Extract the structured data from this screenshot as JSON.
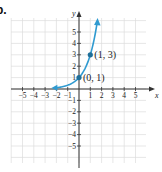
{
  "part_label": "b.",
  "colors": {
    "curve": "#2f9ad0",
    "point": "#1f6f99",
    "grid": "#dcdcdc",
    "axis": "#333333",
    "text": "#222222"
  },
  "chart_data": {
    "type": "line",
    "title": "",
    "function": "y = 3^x",
    "xlabel": "x",
    "ylabel": "y",
    "xlim": [
      -5.9,
      6
    ],
    "ylim": [
      -6.5,
      6.5
    ],
    "grid": true,
    "x_ticks": [
      -5,
      -4,
      -3,
      -2,
      -1,
      1,
      2,
      3,
      4,
      5
    ],
    "y_ticks": [
      -5,
      -4,
      -3,
      -2,
      -1,
      1,
      2,
      3,
      4,
      5
    ],
    "x_tick_labels": [
      "−5",
      "−4",
      "−3",
      "−2",
      "−1",
      "1",
      "2",
      "3",
      "4",
      "5"
    ],
    "y_tick_labels": [
      "−5",
      "−4",
      "−3",
      "−2",
      "−1",
      "1",
      "2",
      "3",
      "4",
      "5"
    ],
    "series": [
      {
        "name": "exponential curve",
        "x": [
          -2,
          -1.5,
          -1,
          -0.5,
          0,
          0.5,
          1,
          1.3,
          1.6
        ],
        "values": [
          0.11,
          0.19,
          0.33,
          0.58,
          1,
          1.73,
          3,
          4.17,
          5.8
        ],
        "arrows": "both"
      }
    ],
    "points": [
      {
        "x": 0,
        "y": 1,
        "label": "(0, 1)"
      },
      {
        "x": 1,
        "y": 3,
        "label": "(1, 3)"
      }
    ]
  }
}
